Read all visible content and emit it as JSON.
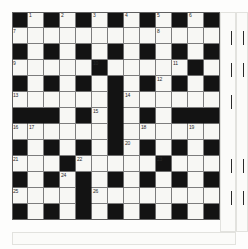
{
  "puzzle": {
    "type": "crossword-grid",
    "columns": 13,
    "rows": 13,
    "cell_size_px": 16,
    "origin_x_px": 12,
    "origin_y_px": 12,
    "colors": {
      "block": "#131313",
      "light": "#f7f7f4",
      "rule": "#7d7d7d",
      "number_text": "#2a2a2a",
      "page": "#fdfdfc"
    },
    "legend": {
      "white_symbol": ".",
      "black_symbol": "#"
    },
    "grid": [
      "#.#.#.#.#.#.#",
      ".............",
      "#.#.#.#.#.#.#",
      ".....#.....#.",
      "#.#.#.#.#.#.#",
      "......#......",
      "###.#.#.#.###",
      "......#......",
      "#.#.#.#.#.#.#",
      "...#.....#...",
      "#.#.#.#.#.#.#",
      "....#........",
      "#.#.#.#.#.#.#"
    ],
    "numbers": [
      {
        "n": 1,
        "row": 1,
        "col": 2
      },
      {
        "n": 2,
        "row": 1,
        "col": 4
      },
      {
        "n": 3,
        "row": 1,
        "col": 6
      },
      {
        "n": 4,
        "row": 1,
        "col": 8
      },
      {
        "n": 5,
        "row": 1,
        "col": 10
      },
      {
        "n": 6,
        "row": 1,
        "col": 12
      },
      {
        "n": 7,
        "row": 2,
        "col": 1
      },
      {
        "n": 8,
        "row": 2,
        "col": 10
      },
      {
        "n": 9,
        "row": 4,
        "col": 1
      },
      {
        "n": 10,
        "row": 4,
        "col": 6
      },
      {
        "n": 11,
        "row": 4,
        "col": 11
      },
      {
        "n": 12,
        "row": 5,
        "col": 10
      },
      {
        "n": 13,
        "row": 6,
        "col": 1
      },
      {
        "n": 14,
        "row": 6,
        "col": 8
      },
      {
        "n": 15,
        "row": 7,
        "col": 6
      },
      {
        "n": 16,
        "row": 8,
        "col": 1
      },
      {
        "n": 17,
        "row": 8,
        "col": 2
      },
      {
        "n": 18,
        "row": 8,
        "col": 9
      },
      {
        "n": 19,
        "row": 8,
        "col": 12
      },
      {
        "n": 20,
        "row": 9,
        "col": 8
      },
      {
        "n": 21,
        "row": 10,
        "col": 1
      },
      {
        "n": 22,
        "row": 10,
        "col": 5
      },
      {
        "n": 23,
        "row": 10,
        "col": 10
      },
      {
        "n": 24,
        "row": 11,
        "col": 4
      },
      {
        "n": 25,
        "row": 12,
        "col": 1
      },
      {
        "n": 26,
        "row": 12,
        "col": 6
      }
    ],
    "margin_ticks": [
      {
        "x": 231,
        "y": 31,
        "h": 14
      },
      {
        "x": 243,
        "y": 31,
        "h": 14
      },
      {
        "x": 231,
        "y": 63,
        "h": 14
      },
      {
        "x": 243,
        "y": 63,
        "h": 14
      },
      {
        "x": 231,
        "y": 95,
        "h": 14
      },
      {
        "x": 231,
        "y": 159,
        "h": 14
      },
      {
        "x": 243,
        "y": 159,
        "h": 14
      },
      {
        "x": 231,
        "y": 191,
        "h": 14
      },
      {
        "x": 243,
        "y": 191,
        "h": 14
      }
    ]
  }
}
